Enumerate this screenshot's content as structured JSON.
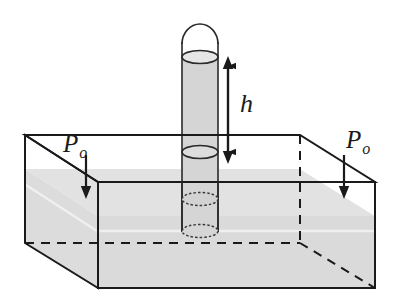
{
  "figure": {
    "type": "physics-diagram"
  },
  "labels": {
    "height_symbol": "h",
    "pressure_left_symbol": "P",
    "pressure_left_subscript": "o",
    "pressure_right_symbol": "P",
    "pressure_right_subscript": "o"
  },
  "colors": {
    "stroke": "#1a1a1a",
    "liquid_fill": "#d8d8d8",
    "liquid_fill_light": "#e4e4e4",
    "tube_fill": "#d4d4d4",
    "tube_empty_fill": "#ffffff",
    "background": "#ffffff",
    "dashed_stroke": "#1a1a1a"
  },
  "geometry": {
    "box": {
      "back_left_top": [
        25,
        135
      ],
      "back_right_top": [
        300,
        135
      ],
      "front_left_top": [
        98,
        182
      ],
      "front_right_top": [
        375,
        182
      ],
      "front_left_bottom": [
        98,
        288
      ],
      "front_right_bottom": [
        375,
        288
      ],
      "left_back_bottom": [
        25,
        243
      ],
      "hidden_back_corner": [
        300,
        243
      ]
    },
    "tube": {
      "left_x": 182,
      "right_x": 218,
      "top_y": 24,
      "bottom_y": 232,
      "cap_radius": 18,
      "meniscus_y": 58,
      "ellipse_ry": 7
    },
    "h_arrow": {
      "x": 228,
      "top_y": 57,
      "bottom_y": 162
    },
    "pressure_arrow_left": {
      "x": 86,
      "top_y": 152,
      "bottom_y": 196
    },
    "pressure_arrow_right": {
      "x": 355,
      "top_y": 152,
      "bottom_y": 196
    }
  }
}
